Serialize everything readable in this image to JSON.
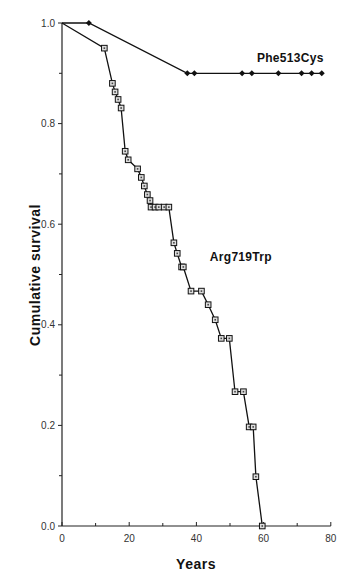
{
  "chart_data": {
    "type": "line",
    "subtype": "kaplan-meier survival curve",
    "title": "",
    "xlabel": "Years",
    "ylabel": "Cumulative survival",
    "xlim": [
      0,
      80
    ],
    "ylim": [
      0.0,
      1.0
    ],
    "x_ticks": [
      0,
      20,
      40,
      60,
      80
    ],
    "x_minor_ticks": [
      10,
      30,
      50,
      70
    ],
    "y_ticks": [
      0.0,
      0.2,
      0.4,
      0.6,
      0.8,
      1.0
    ],
    "y_tick_labels": [
      "0.0",
      "0.2",
      "0.4",
      "0.6",
      "0.8",
      "1.0"
    ],
    "y_minor_ticks": [
      0.1,
      0.3,
      0.5,
      0.7,
      0.9
    ],
    "grid": false,
    "legend": "inline labels",
    "series": [
      {
        "name": "Phe513Cys",
        "marker": "filled-diamond",
        "label_position": {
          "x": 58,
          "y": 0.93
        },
        "line_from": {
          "x": 0,
          "y": 1.0
        },
        "x": [
          8,
          37.3,
          39.4,
          53.6,
          56.5,
          64.4,
          71.3,
          74.3,
          77.3
        ],
        "y": [
          1.0,
          0.9,
          0.9,
          0.9,
          0.9,
          0.9,
          0.9,
          0.9,
          0.9
        ]
      },
      {
        "name": "Arg719Trp",
        "marker": "open-square",
        "label_position": {
          "x": 44,
          "y": 0.535
        },
        "line_from": {
          "x": 0,
          "y": 1.0
        },
        "x": [
          12.6,
          15.0,
          15.8,
          16.7,
          17.6,
          18.8,
          19.7,
          22.5,
          23.6,
          24.5,
          25.4,
          26.2,
          26.5,
          27.7,
          28.8,
          30.4,
          31.8,
          33.3,
          34.3,
          35.6,
          36.1,
          38.4,
          41.5,
          43.5,
          45.6,
          47.4,
          49.8,
          51.5,
          54.0,
          55.7,
          56.9,
          57.7,
          59.6
        ],
        "y": [
          0.95,
          0.88,
          0.863,
          0.848,
          0.831,
          0.745,
          0.728,
          0.71,
          0.693,
          0.676,
          0.659,
          0.647,
          0.634,
          0.634,
          0.634,
          0.634,
          0.634,
          0.563,
          0.542,
          0.515,
          0.515,
          0.467,
          0.467,
          0.44,
          0.41,
          0.373,
          0.373,
          0.267,
          0.267,
          0.197,
          0.197,
          0.098,
          0.0
        ]
      }
    ]
  }
}
